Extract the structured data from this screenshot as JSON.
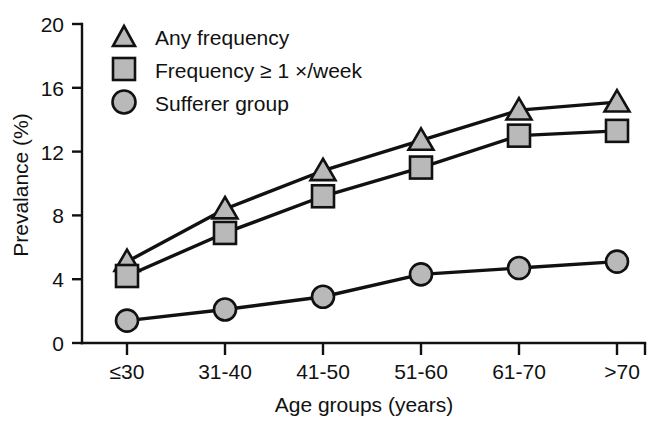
{
  "chart_data": {
    "type": "line",
    "title": "",
    "subtitle": "",
    "xlabel": "Age groups (years)",
    "ylabel": "Prevalance (%)",
    "categories": [
      "≤30",
      "31-40",
      "41-50",
      "51-60",
      "61-70",
      ">70"
    ],
    "ytick_labels": [
      "0",
      "4",
      "8",
      "12",
      "16",
      "20"
    ],
    "ytick_values": [
      0,
      4,
      8,
      12,
      16,
      20
    ],
    "ylim": [
      0,
      20
    ],
    "grid": false,
    "legend_position": "top-left",
    "series": [
      {
        "name": "Any frequency",
        "marker": "triangle",
        "marker_color": "#b9b9b9",
        "line_color": "#111111",
        "values": [
          5.1,
          8.4,
          10.8,
          12.7,
          14.6,
          15.1
        ]
      },
      {
        "name": "Frequency ≥ 1 ×/week",
        "marker": "square",
        "marker_color": "#b9b9b9",
        "line_color": "#111111",
        "values": [
          4.2,
          6.9,
          9.2,
          11.0,
          13.0,
          13.3
        ]
      },
      {
        "name": "Sufferer group",
        "marker": "circle",
        "marker_color": "#b9b9b9",
        "line_color": "#111111",
        "values": [
          1.4,
          2.1,
          2.9,
          4.3,
          4.7,
          5.1
        ]
      }
    ]
  },
  "axes": {
    "y_title": "Prevalance (%)",
    "x_title": "Age groups (years)",
    "y_ticks": [
      "20",
      "16",
      "12",
      "8",
      "4",
      "0"
    ],
    "x_ticks": [
      "≤30",
      "31-40",
      "41-50",
      "51-60",
      "61-70",
      ">70"
    ]
  },
  "legend": {
    "entries": [
      {
        "label": "Any frequency",
        "marker": "triangle-marker"
      },
      {
        "label": "Frequency ≥ 1 ×/week",
        "marker": "square-marker"
      },
      {
        "label": "Sufferer group",
        "marker": "circle-marker"
      }
    ]
  }
}
